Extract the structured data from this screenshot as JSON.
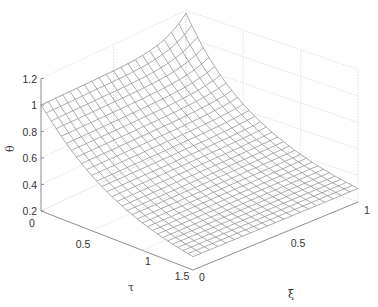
{
  "chart_data": {
    "type": "surface",
    "title": "",
    "xlabel": "τ",
    "ylabel": "ξ",
    "zlabel": "θ",
    "x_ticks": [
      "0",
      "0.5",
      "1",
      "1.5"
    ],
    "y_ticks": [
      "0",
      "0.5",
      "1"
    ],
    "z_ticks": [
      "0.2",
      "0.4",
      "0.6",
      "0.8",
      "1",
      "1.2"
    ],
    "xlim": [
      0,
      1.5
    ],
    "ylim": [
      0,
      1
    ],
    "zlim": [
      0.2,
      1.2
    ],
    "grid": true,
    "mesh_resolution": {
      "xi_cells": 20,
      "tau_cells": 30
    },
    "sample_points": [
      {
        "tau": 0,
        "xi": 0,
        "theta": 1.0
      },
      {
        "tau": 0,
        "xi": 1,
        "theta": 1.15
      },
      {
        "tau": 0.5,
        "xi": 0,
        "theta": 0.62
      },
      {
        "tau": 1.0,
        "xi": 0,
        "theta": 0.38
      },
      {
        "tau": 1.5,
        "xi": 0,
        "theta": 0.22
      },
      {
        "tau": 1.5,
        "xi": 1,
        "theta": 0.23
      }
    ],
    "colors": {
      "mesh": "#8a8a8a",
      "axes": "#888888",
      "grid": "#e2e2e2",
      "background": "#ffffff"
    }
  }
}
